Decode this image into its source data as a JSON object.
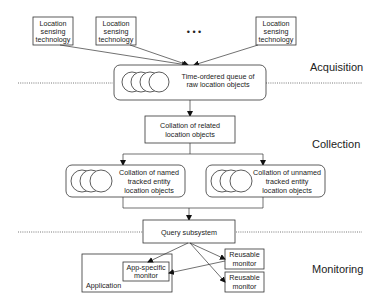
{
  "diagram": {
    "stages": {
      "acquisition": "Acquisition",
      "collection": "Collection",
      "monitoring": "Monitoring"
    },
    "sensors": [
      {
        "line1": "Location",
        "line2": "sensing",
        "line3": "technology"
      },
      {
        "line1": "Location",
        "line2": "sensing",
        "line3": "technology"
      },
      {
        "line1": "Location",
        "line2": "sensing",
        "line3": "technology"
      }
    ],
    "ellipsis": "•   •   •",
    "queue": {
      "line1": "Time-ordered queue of",
      "line2": "raw location objects"
    },
    "collation_related": {
      "line1": "Collation of related",
      "line2": "location objects"
    },
    "collation_named": {
      "line1": "Collation of named",
      "line2": "tracked entity",
      "line3": "location objects"
    },
    "collation_unnamed": {
      "line1": "Collation of unnamed",
      "line2": "tracked entity",
      "line3": "location objects"
    },
    "query": "Query subsystem",
    "application": "Application",
    "app_monitor": {
      "line1": "App-specific",
      "line2": "monitor"
    },
    "reusable_monitors": [
      {
        "line1": "Reusable",
        "line2": "monitor"
      },
      {
        "line1": "Reusable",
        "line2": "monitor"
      }
    ]
  }
}
